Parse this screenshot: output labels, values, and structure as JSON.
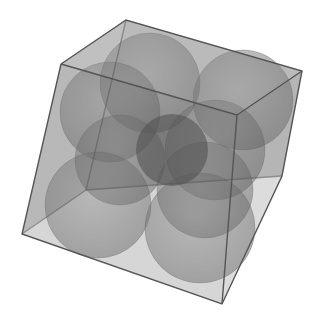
{
  "scene": {
    "description": "3D rendering of a translucent gray cube containing eight translucent gray spheres arranged in a 2x2x2 grid",
    "colors": {
      "background": "#ffffff",
      "face": "#8a8a8a",
      "edge": "#555555",
      "sphere": "#6a6a6a",
      "center_shadow": "#2e2e2e"
    },
    "cube_vertices": {
      "top_back": [
        126,
        20
      ],
      "top_left": [
        61,
        64
      ],
      "top_right": [
        302,
        71
      ],
      "top_front": [
        237,
        115
      ],
      "bottom_back": [
        86,
        190
      ],
      "bottom_left": [
        22,
        234
      ],
      "bottom_right": [
        282,
        176
      ],
      "bottom_front": [
        222,
        304
      ]
    },
    "spheres": [
      {
        "cx": 150,
        "cy": 83,
        "r": 50
      },
      {
        "cx": 243,
        "cy": 100,
        "r": 50
      },
      {
        "cx": 110,
        "cy": 110,
        "r": 50
      },
      {
        "cx": 222,
        "cy": 148,
        "r": 50
      },
      {
        "cx": 98,
        "cy": 205,
        "r": 53
      },
      {
        "cx": 200,
        "cy": 228,
        "r": 55
      },
      {
        "cx": 120,
        "cy": 160,
        "r": 45
      },
      {
        "cx": 210,
        "cy": 185,
        "r": 48
      }
    ],
    "center_sphere": {
      "cx": 172,
      "cy": 150,
      "r": 36
    }
  }
}
